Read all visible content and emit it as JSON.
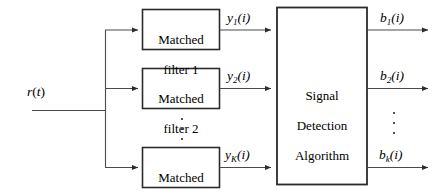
{
  "diagram": {
    "input": {
      "label_r": "r",
      "label_t": "t",
      "name": "r(t)"
    },
    "filters": [
      {
        "line1": "Matched",
        "line2": "filter 1"
      },
      {
        "line1": "Matched",
        "line2": "filter 2"
      },
      {
        "line1": "Matched",
        "line2": "filter K"
      }
    ],
    "processor": {
      "line1": "Signal",
      "line2": "Detection",
      "line3": "Algorithm"
    },
    "intermediate_signals": [
      {
        "base": "y",
        "sub": "1",
        "arg": "(i)"
      },
      {
        "base": "y",
        "sub": "2",
        "arg": "(i)"
      },
      {
        "base": "y",
        "sub": "K",
        "arg": "(i)"
      }
    ],
    "output_signals": [
      {
        "base": "b",
        "sub": "1",
        "arg": "(i)"
      },
      {
        "base": "b",
        "sub": "2",
        "arg": "(i)"
      },
      {
        "base": "b",
        "sub": "k",
        "arg": "(i)"
      }
    ],
    "ellipsis": {
      "filters_column": "vertical-dots",
      "outputs_column": "vertical-dots"
    },
    "colors": {
      "stroke": "#3a3a3a",
      "box_stroke": "#2b2b2b",
      "text": "#000000",
      "background": "#ffffff"
    }
  }
}
